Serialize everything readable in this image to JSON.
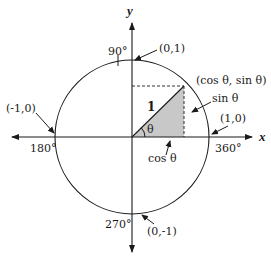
{
  "diagram": {
    "type": "unit-circle",
    "axes": {
      "x_label": "x",
      "y_label": "y"
    },
    "points": {
      "top": "(0,1)",
      "bottom": "(0,-1)",
      "left": "(-1,0)",
      "right": "(1,0)",
      "on_circle": "(cos θ, sin θ)"
    },
    "angles": {
      "deg90": "90°",
      "deg180": "180°",
      "deg270": "270°",
      "deg360": "360°"
    },
    "triangle": {
      "hypotenuse": "1",
      "angle": "θ",
      "adjacent": "cos θ",
      "opposite": "sin θ"
    },
    "colors": {
      "line": "#1a1a1a",
      "shade": "#c8c8c8",
      "background": "#ffffff"
    }
  }
}
